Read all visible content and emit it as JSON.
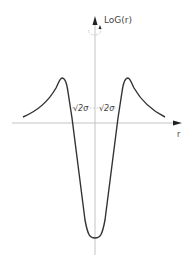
{
  "diagram": {
    "y_axis_label": "LoG(r)",
    "x_axis_label": "r",
    "annotations": {
      "left_crossing": "-√2σ",
      "right_crossing": "√2σ",
      "left_text": "√2σ",
      "right_text": "√2σ"
    },
    "colors": {
      "curve": "#333333",
      "axes": "#bbbbbb",
      "arrow": "#222222",
      "text": "#444444"
    }
  }
}
